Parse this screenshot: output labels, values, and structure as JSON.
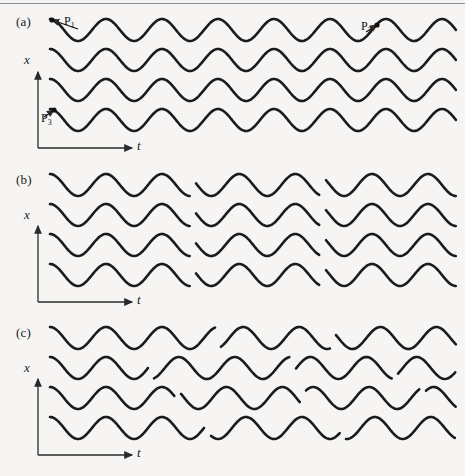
{
  "figure": {
    "background_color": "#f6f5f3",
    "line_color": "#1b1b1b",
    "axis_color": "#2a2a2a",
    "width": 465,
    "height": 476
  },
  "panels": [
    {
      "id": "a",
      "label": "(a)",
      "x_axis_label": "x",
      "t_axis_label": "t",
      "description": "coherent wave trains, no phase breaks",
      "rows": 4,
      "annotations": [
        {
          "name": "P1",
          "text": "P",
          "sub": "1"
        },
        {
          "name": "P2",
          "text": "P",
          "sub": "2"
        },
        {
          "name": "P3",
          "text": "P",
          "sub": "3"
        }
      ]
    },
    {
      "id": "b",
      "label": "(b)",
      "x_axis_label": "x",
      "t_axis_label": "t",
      "description": "wave trains with aligned phase discontinuities",
      "rows": 4,
      "annotations": []
    },
    {
      "id": "c",
      "label": "(c)",
      "x_axis_label": "x",
      "t_axis_label": "t",
      "description": "wave trains with random phase discontinuities",
      "rows": 4,
      "annotations": []
    }
  ],
  "chart_data": {
    "type": "line",
    "title": "",
    "xlabel": "t",
    "ylabel": "x",
    "grid": false,
    "legend": "none",
    "panels": [
      {
        "id": "a",
        "wavelength": 56,
        "amplitude": 11,
        "x_start": 50,
        "x_end": 456,
        "row_baselines": [
          30,
          60,
          90,
          120
        ],
        "breaks": [],
        "phase_offsets": [
          0,
          0,
          0,
          0
        ]
      },
      {
        "id": "b",
        "wavelength": 56,
        "amplitude": 11,
        "x_start": 50,
        "x_end": 456,
        "row_baselines": [
          185,
          215,
          245,
          275
        ],
        "breaks": [
          190,
          320
        ],
        "phase_offsets": [
          0,
          0,
          0,
          0
        ],
        "segment_phase_shifts": [
          0,
          0.62,
          1.25
        ]
      },
      {
        "id": "c",
        "wavelength": 56,
        "amplitude": 11,
        "x_start": 50,
        "x_end": 456,
        "row_baselines": [
          338,
          368,
          398,
          428
        ],
        "row_breaks": [
          [
            215,
            330
          ],
          [
            148,
            290,
            392
          ],
          [
            175,
            300,
            420
          ],
          [
            205,
            340
          ]
        ],
        "row_segment_phase_shifts": [
          [
            0,
            0.55,
            1.1
          ],
          [
            0,
            0.7,
            1.35,
            0.45
          ],
          [
            0,
            0.85,
            0.3,
            1.15
          ],
          [
            0,
            0.5,
            1.2
          ]
        ]
      }
    ]
  }
}
